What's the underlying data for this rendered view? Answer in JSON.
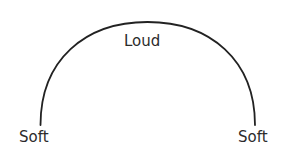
{
  "diagram": {
    "type": "arc",
    "labels": {
      "top": "Loud",
      "left": "Soft",
      "right": "Soft"
    },
    "stroke_color": "#222222",
    "text_color": "#2b2b2b"
  }
}
